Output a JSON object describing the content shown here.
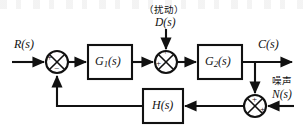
{
  "figure": {
    "kind": "control-system-block-diagram",
    "width": 303,
    "height": 132,
    "background_color": "#ffffff",
    "line_color": "#111111"
  },
  "signals": {
    "input_label": "R(s)",
    "input_base": "R",
    "input_arg": "s",
    "output_label": "C(s)",
    "output_base": "C",
    "output_arg": "s",
    "disturbance_caption": "（扰动）",
    "disturbance_label": "D(s)",
    "disturbance_base": "D",
    "disturbance_arg": "s",
    "noise_caption": "噪声",
    "noise_label": "N(s)",
    "noise_base": "N",
    "noise_arg": "s"
  },
  "blocks": [
    {
      "id": "g1",
      "label": "G1(s)",
      "base": "G",
      "subscript": "1",
      "arg": "s",
      "x": 88,
      "y": 45,
      "width": 44,
      "height": 34
    },
    {
      "id": "g2",
      "label": "G2(s)",
      "base": "G",
      "subscript": "2",
      "arg": "s",
      "x": 198,
      "y": 45,
      "width": 44,
      "height": 34
    },
    {
      "id": "h",
      "label": "H(s)",
      "base": "H",
      "subscript": "",
      "arg": "s",
      "x": 143,
      "y": 89,
      "width": 40,
      "height": 34
    }
  ],
  "summing_junctions": [
    {
      "id": "sum-error",
      "cx": 57,
      "cy": 62,
      "r": 11,
      "signs": {
        "left": "+",
        "bottom": "−",
        "top": "",
        "right": ""
      }
    },
    {
      "id": "sum-disturbance",
      "cx": 166,
      "cy": 62,
      "r": 11,
      "signs": {
        "left": "+",
        "top": "+",
        "bottom": "",
        "right": ""
      }
    },
    {
      "id": "sum-noise",
      "cx": 255,
      "cy": 106,
      "r": 11,
      "signs": {
        "top": "+",
        "right": "+",
        "left": "",
        "bottom": ""
      }
    }
  ],
  "connections": [
    {
      "id": "r-to-sum-error",
      "from": "R(s)",
      "to": "sum-error"
    },
    {
      "id": "sum-error-to-g1",
      "from": "sum-error",
      "to": "g1"
    },
    {
      "id": "g1-to-sum-disturbance",
      "from": "g1",
      "to": "sum-disturbance"
    },
    {
      "id": "d-to-sum-disturbance",
      "from": "D(s)",
      "to": "sum-disturbance"
    },
    {
      "id": "sum-disturbance-to-g2",
      "from": "sum-disturbance",
      "to": "g2"
    },
    {
      "id": "g2-to-output",
      "from": "g2",
      "to": "C(s)"
    },
    {
      "id": "output-tap-to-sum-noise",
      "from": "C(s)",
      "to": "sum-noise"
    },
    {
      "id": "n-to-sum-noise",
      "from": "N(s)",
      "to": "sum-noise"
    },
    {
      "id": "sum-noise-to-h",
      "from": "sum-noise",
      "to": "h"
    },
    {
      "id": "h-to-sum-error",
      "from": "h",
      "to": "sum-error"
    }
  ]
}
